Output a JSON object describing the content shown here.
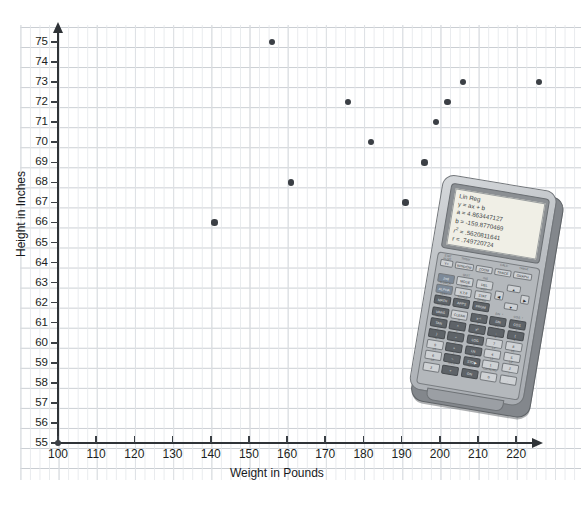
{
  "chart_data": {
    "type": "scatter",
    "title": "",
    "xlabel": "Weight in Pounds",
    "ylabel": "Height in Inches",
    "xlim": [
      100,
      225
    ],
    "ylim": [
      55,
      75
    ],
    "xticks": [
      100,
      110,
      120,
      130,
      140,
      150,
      160,
      170,
      180,
      190,
      200,
      210,
      220
    ],
    "yticks": [
      55,
      56,
      57,
      58,
      59,
      60,
      61,
      62,
      63,
      64,
      65,
      66,
      67,
      68,
      69,
      70,
      71,
      72,
      73,
      74,
      75
    ],
    "grid": true,
    "legend": false,
    "points": [
      {
        "x": 100,
        "y": 55
      },
      {
        "x": 141,
        "y": 66
      },
      {
        "x": 156,
        "y": 75
      },
      {
        "x": 161,
        "y": 68
      },
      {
        "x": 176,
        "y": 72
      },
      {
        "x": 182,
        "y": 70
      },
      {
        "x": 191,
        "y": 67
      },
      {
        "x": 196,
        "y": 69
      },
      {
        "x": 199,
        "y": 71
      },
      {
        "x": 202,
        "y": 72
      },
      {
        "x": 206,
        "y": 73
      },
      {
        "x": 226,
        "y": 73
      }
    ],
    "marker_color": "#3b3f45",
    "grid_color": "#c9cdd2",
    "axis_color": "#2f3337"
  },
  "calculator": {
    "screen": {
      "title": "Lin Reg",
      "equation": "y = ax + b",
      "slope": "a = 4.863447127",
      "intercept": "b = -159.8770469",
      "r_squared_label": "r",
      "r_squared_exponent": "2",
      "r_squared_value": "= .5620811641",
      "correlation": "r = .749720724"
    },
    "soft_keys": [
      {
        "label": "Y=",
        "caption": "STAT PLOT"
      },
      {
        "label": "WINDOW",
        "caption": "TblSet"
      },
      {
        "label": "ZOOM",
        "caption": ""
      },
      {
        "label": "TRACE",
        "caption": "CALC"
      },
      {
        "label": "GRAPH",
        "caption": "TABLE"
      }
    ],
    "keys": [
      {
        "label": "2nd",
        "caption": "",
        "style": "blue"
      },
      {
        "label": "MODE",
        "caption": "QUIT"
      },
      {
        "label": "DEL",
        "caption": "INS"
      },
      {
        "label": "ALPHA",
        "caption": "A-LOCK",
        "style": "blue"
      },
      {
        "label": "X,T,θ",
        "caption": "LINK"
      },
      {
        "label": "STAT",
        "caption": "LIST"
      },
      {
        "label": "MATH",
        "caption": "TEST",
        "style": "dark"
      },
      {
        "label": "APPS",
        "caption": "ANGLE",
        "style": "dark"
      },
      {
        "label": "PRGM",
        "caption": "DRAW",
        "style": "dark"
      },
      {
        "label": "VARS",
        "caption": "DISTR",
        "style": "dark"
      },
      {
        "label": "CLEAR",
        "caption": ""
      },
      {
        "label": "x⁻¹",
        "caption": "",
        "style": "dark"
      },
      {
        "label": "SIN",
        "caption": "SIN⁻¹",
        "style": "dark"
      },
      {
        "label": "COS",
        "caption": "COS⁻¹",
        "style": "dark"
      },
      {
        "label": "TAN",
        "caption": "TAN⁻¹",
        "style": "dark"
      },
      {
        "label": "^",
        "caption": "π",
        "style": "dark"
      },
      {
        "label": "x²",
        "caption": "√",
        "style": "dark"
      },
      {
        "label": ",",
        "caption": "EE",
        "style": "dark"
      },
      {
        "label": "(",
        "caption": "{",
        "style": "dark"
      },
      {
        "label": ")",
        "caption": "}",
        "style": "dark"
      },
      {
        "label": "÷",
        "caption": "e",
        "style": "dark"
      },
      {
        "label": "LOG",
        "caption": "10ˣ",
        "style": "dark"
      },
      {
        "label": "7",
        "caption": "u"
      },
      {
        "label": "8",
        "caption": "v"
      },
      {
        "label": "9",
        "caption": "w"
      },
      {
        "label": "×",
        "caption": "[",
        "style": "dark"
      },
      {
        "label": "LN",
        "caption": "eˣ",
        "style": "dark"
      },
      {
        "label": "4",
        "caption": "L4"
      },
      {
        "label": "5",
        "caption": "L5"
      },
      {
        "label": "6",
        "caption": "L6"
      },
      {
        "label": "−",
        "caption": "]",
        "style": "dark"
      },
      {
        "label": "STO▶",
        "caption": "RCL",
        "style": "dark"
      },
      {
        "label": "1",
        "caption": "L1"
      },
      {
        "label": "2",
        "caption": "L2"
      },
      {
        "label": "3",
        "caption": "L3"
      },
      {
        "label": "+",
        "caption": "MEM",
        "style": "dark"
      },
      {
        "label": "ON",
        "caption": "OFF",
        "style": "dark"
      },
      {
        "label": "0",
        "caption": "CATALOG"
      },
      {
        "label": ".",
        "caption": "i"
      },
      {
        "label": "(−)",
        "caption": "ANS"
      },
      {
        "label": "ENTER",
        "caption": "SOLVE",
        "style": "dark"
      }
    ],
    "arrow_keys": [
      {
        "label": "▲",
        "name": "arrow-up-key"
      },
      {
        "label": "◀",
        "name": "arrow-left-key"
      },
      {
        "label": "▶",
        "name": "arrow-right-key"
      },
      {
        "label": "▼",
        "name": "arrow-down-key"
      }
    ]
  }
}
